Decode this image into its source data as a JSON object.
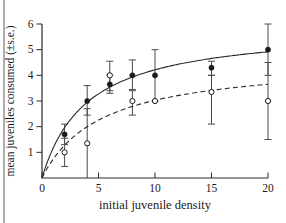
{
  "figure": {
    "xlabel": "initial juvenile density",
    "ylabel": "mean juveniles consumed (±s.e.)"
  },
  "chart_data": {
    "type": "scatter",
    "title": "",
    "xlabel": "initial juvenile density",
    "ylabel": "mean juveniles consumed (±s.e.)",
    "xlim": [
      0,
      20
    ],
    "ylim": [
      0,
      6
    ],
    "x_ticks": [
      0,
      5,
      10,
      15,
      20
    ],
    "x_tick_labels": [
      "0",
      "5",
      "10",
      "15",
      "20"
    ],
    "y_ticks": [
      1,
      2,
      3,
      4,
      5,
      6
    ],
    "y_tick_labels": [
      "1",
      "2",
      "3",
      "4",
      "5",
      "6"
    ],
    "grid": false,
    "legend": "none",
    "series": [
      {
        "name": "filled circles (solid fit)",
        "marker": "filled-circle",
        "line_style": "solid",
        "x": [
          2,
          4,
          6,
          8,
          10,
          15,
          20
        ],
        "y": [
          1.7,
          3.0,
          3.65,
          4.0,
          4.0,
          4.3,
          5.0
        ],
        "err_lo": [
          1.3,
          2.45,
          3.3,
          3.45,
          3.0,
          4.0,
          4.0
        ],
        "err_hi": [
          2.1,
          3.6,
          4.0,
          4.6,
          5.0,
          4.55,
          6.0
        ],
        "fit_curve": {
          "model": "michaelis-menten",
          "vmax": 5.9,
          "k": 4.0
        }
      },
      {
        "name": "open circles (dashed fit)",
        "marker": "open-circle",
        "line_style": "dashed",
        "x": [
          2,
          4,
          6,
          8,
          10,
          15,
          20
        ],
        "y": [
          1.0,
          1.35,
          4.0,
          3.0,
          3.0,
          3.35,
          3.0
        ],
        "err_lo": [
          0.45,
          0.0,
          3.4,
          2.45,
          3.0,
          2.1,
          1.5
        ],
        "err_hi": [
          1.55,
          2.7,
          4.55,
          3.4,
          3.0,
          4.0,
          4.5
        ],
        "fit_curve": {
          "model": "michaelis-menten",
          "vmax": 4.6,
          "k": 5.2
        }
      }
    ],
    "colors": {
      "data": "#1a1a1a",
      "curve": "#2a2a2a",
      "error_bars": "#4a4a4a",
      "axis": "#2a2a2a",
      "tick_text": "#1a1a1a",
      "page_border": "#adadad",
      "background": "#ffffff"
    }
  }
}
